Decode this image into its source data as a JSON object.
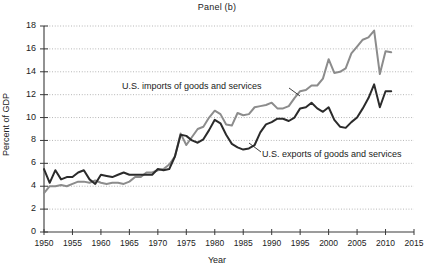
{
  "panel": {
    "title": "Panel (b)"
  },
  "chart_data": {
    "type": "line",
    "title": "Panel (b)",
    "xlabel": "Year",
    "ylabel": "Percent of GDP",
    "xlim": [
      1950,
      2015
    ],
    "ylim": [
      0,
      18
    ],
    "grid": true,
    "legend_position": "inline-annotation",
    "x_ticks": [
      1950,
      1955,
      1960,
      1965,
      1970,
      1975,
      1980,
      1985,
      1990,
      1995,
      2000,
      2005,
      2010,
      2015
    ],
    "y_ticks": [
      0,
      2,
      4,
      6,
      8,
      10,
      12,
      14,
      16,
      18
    ],
    "x": [
      1950,
      1951,
      1952,
      1953,
      1954,
      1955,
      1956,
      1957,
      1958,
      1959,
      1960,
      1961,
      1962,
      1963,
      1964,
      1965,
      1966,
      1967,
      1968,
      1969,
      1970,
      1971,
      1972,
      1973,
      1974,
      1975,
      1976,
      1977,
      1978,
      1979,
      1980,
      1981,
      1982,
      1983,
      1984,
      1985,
      1986,
      1987,
      1988,
      1989,
      1990,
      1991,
      1992,
      1993,
      1994,
      1995,
      1996,
      1997,
      1998,
      1999,
      2000,
      2001,
      2002,
      2003,
      2004,
      2005,
      2006,
      2007,
      2008,
      2009,
      2010,
      2011
    ],
    "series": [
      {
        "name": "U.S. exports of goods and services",
        "color": "#2b2b2b",
        "values": [
          5.5,
          4.3,
          5.4,
          4.6,
          4.8,
          4.8,
          5.2,
          5.4,
          4.6,
          4.2,
          5.0,
          4.9,
          4.8,
          5.0,
          5.2,
          5.0,
          5.0,
          5.0,
          5.0,
          5.0,
          5.5,
          5.4,
          5.5,
          6.6,
          8.5,
          8.4,
          8.0,
          7.8,
          8.1,
          8.9,
          9.8,
          9.5,
          8.5,
          7.7,
          7.4,
          7.2,
          7.3,
          7.6,
          8.7,
          9.4,
          9.6,
          9.9,
          9.9,
          9.7,
          10.0,
          10.8,
          10.9,
          11.3,
          10.8,
          10.5,
          10.9,
          9.8,
          9.2,
          9.1,
          9.6,
          10.0,
          10.8,
          11.7,
          12.9,
          10.9,
          12.3,
          12.3
        ]
      },
      {
        "name": "U.S. imports of goods and services",
        "color": "#8c8c8c",
        "values": [
          3.4,
          4.0,
          4.0,
          4.1,
          4.0,
          4.2,
          4.4,
          4.4,
          4.3,
          4.5,
          4.3,
          4.2,
          4.3,
          4.3,
          4.2,
          4.4,
          4.8,
          4.8,
          5.2,
          5.2,
          5.4,
          5.5,
          5.9,
          6.6,
          8.6,
          7.6,
          8.3,
          9.0,
          9.2,
          10.0,
          10.6,
          10.3,
          9.4,
          9.3,
          10.4,
          10.2,
          10.3,
          10.9,
          11.0,
          11.1,
          11.3,
          10.8,
          10.8,
          11.0,
          11.7,
          12.3,
          12.4,
          12.8,
          12.8,
          13.4,
          15.1,
          13.9,
          14.0,
          14.3,
          15.6,
          16.2,
          16.8,
          17.0,
          17.6,
          13.8,
          15.8,
          15.7
        ]
      }
    ],
    "annotations": [
      {
        "id": "imports",
        "text": "U.S. imports of goods and services",
        "points_to_year": 1998
      },
      {
        "id": "exports",
        "text": "U.S. exports of goods and services",
        "points_to_year": 1986
      }
    ]
  },
  "axes": {
    "y_tick_labels": [
      "18",
      "16",
      "14",
      "12",
      "10",
      "8",
      "6",
      "4",
      "2",
      "0"
    ],
    "x_tick_labels": [
      "1950",
      "1955",
      "1960",
      "1965",
      "1970",
      "1975",
      "1980",
      "1985",
      "1990",
      "1995",
      "2000",
      "2005",
      "2010",
      "2015"
    ],
    "y_title": "Percent of GDP",
    "x_title": "Year"
  }
}
